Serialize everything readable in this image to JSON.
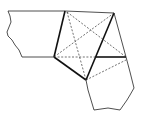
{
  "diagram": {
    "type": "geometric-tiling-fragment",
    "colors": {
      "line": "#222222",
      "background": "#ffffff"
    },
    "vertices": {
      "A": [
        54,
        57
      ],
      "B": [
        65,
        11
      ],
      "C": [
        114,
        13
      ],
      "D": [
        126,
        57
      ],
      "E": [
        96,
        57
      ],
      "F": [
        86,
        80
      ]
    }
  }
}
